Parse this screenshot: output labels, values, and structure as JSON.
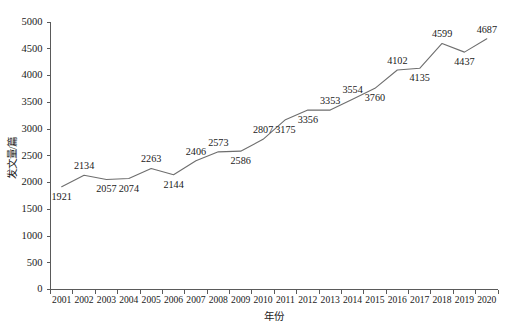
{
  "chart_data": {
    "type": "line",
    "title": "",
    "xlabel": "年份",
    "ylabel": "发文量/篇",
    "categories": [
      "2001",
      "2002",
      "2003",
      "2004",
      "2005",
      "2006",
      "2007",
      "2008",
      "2009",
      "2010",
      "2011",
      "2012",
      "2013",
      "2014",
      "2015",
      "2016",
      "2017",
      "2018",
      "2019",
      "2020"
    ],
    "values": [
      1921,
      2134,
      2057,
      2074,
      2263,
      2144,
      2406,
      2573,
      2586,
      2807,
      3175,
      3356,
      3353,
      3554,
      3760,
      4102,
      4135,
      4599,
      4437,
      4687
    ],
    "series": [
      {
        "name": "发文量",
        "values": [
          1921,
          2134,
          2057,
          2074,
          2263,
          2144,
          2406,
          2573,
          2586,
          2807,
          3175,
          3356,
          3353,
          3554,
          3760,
          4102,
          4135,
          4599,
          4437,
          4687
        ]
      }
    ],
    "point_labels": [
      "1921",
      "2134",
      "2057",
      "2074",
      "2263",
      "2144",
      "2406",
      "2573",
      "2586",
      "2807",
      "3175",
      "3356",
      "3353",
      "3554",
      "3760",
      "4102",
      "4135",
      "4599",
      "4437",
      "4687"
    ],
    "label_positions": [
      "below",
      "above",
      "below",
      "below",
      "above",
      "below",
      "above",
      "above",
      "below",
      "above",
      "below",
      "below",
      "above",
      "above",
      "below",
      "above",
      "below",
      "above",
      "below",
      "above"
    ],
    "ylim": [
      0,
      5000
    ],
    "yticks": [
      0,
      500,
      1000,
      1500,
      2000,
      2500,
      3000,
      3500,
      4000,
      4500,
      5000
    ],
    "ytick_labels": [
      "0",
      "500",
      "1000",
      "1500",
      "2000",
      "2500",
      "3000",
      "3500",
      "4000",
      "4500",
      "5000"
    ],
    "grid": false,
    "legend": false,
    "legend_position": "none",
    "line_color": "#6e6e6e",
    "axis_color": "#5a5a5a",
    "background_color": "#ffffff"
  }
}
